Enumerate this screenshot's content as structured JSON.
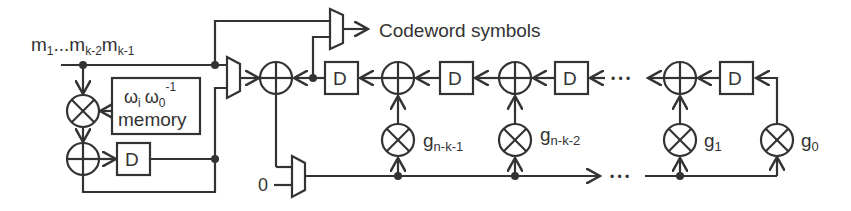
{
  "diagram": {
    "input_label": {
      "base": "m",
      "parts": [
        "1",
        "...m",
        "k-2",
        "m",
        "k-1"
      ]
    },
    "output_label": "Codeword symbols",
    "memory_block": {
      "line1_a": "ω",
      "line1_a_sub": "i",
      "line1_b": "ω",
      "line1_b_sub": "0",
      "line1_b_sup": "-1",
      "line2": "memory"
    },
    "delay_label": "D",
    "zero_input": "0",
    "coefficients": [
      {
        "base": "g",
        "sub": "n-k-1"
      },
      {
        "base": "g",
        "sub": "n-k-2"
      },
      {
        "base": "g",
        "sub": "1"
      },
      {
        "base": "g",
        "sub": "0"
      }
    ],
    "ellipsis": "• • •",
    "colors": {
      "line": "#333333",
      "background": "#ffffff"
    }
  }
}
